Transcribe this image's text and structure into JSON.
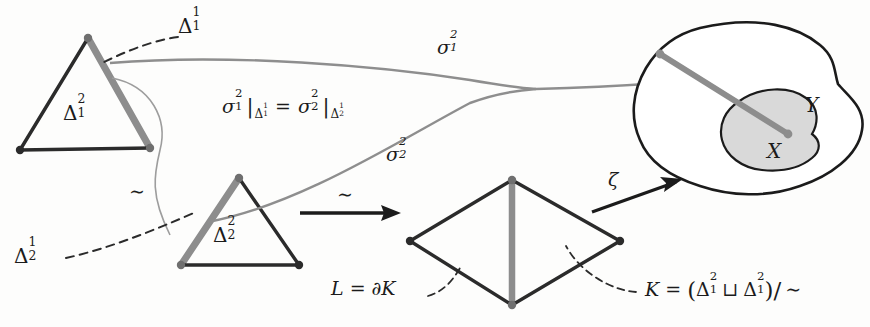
{
  "figure": {
    "colors": {
      "ink": "#1b1b1b",
      "gray_edge": "#8a8a8a",
      "gray_curve": "#9a9a9a",
      "shade_x": "#d8d8d8",
      "background": "#fdfdfc"
    },
    "labels": {
      "delta_1_1": {
        "base": "Δ",
        "sup": "1",
        "sub": "1"
      },
      "delta_1_2": {
        "base": "Δ",
        "sup": "2",
        "sub": "1"
      },
      "delta_2_1": {
        "base": "Δ",
        "sup": "1",
        "sub": "2"
      },
      "delta_2_2": {
        "base": "Δ",
        "sup": "2",
        "sub": "2"
      },
      "sigma_1_2": {
        "base": "σ",
        "sup": "2",
        "sub": "1"
      },
      "sigma_2_2": {
        "base": "σ",
        "sup": "2",
        "sub": "2"
      },
      "restriction_equation": "σ₁²|_{Δ₁¹} = σ₂²|_{Δ₂¹}",
      "zeta": "ζ",
      "tilde_left": "∼",
      "tilde_arrow": "∼",
      "space_y": "Y",
      "space_x": "X",
      "boundary_eq_lhs": "L",
      "boundary_eq_op": "=",
      "boundary_eq_rhs": "∂K",
      "quotient_eq": "K = (Δ₁² ⊔ Δ₁²)/ ∼",
      "quotient_K": "K",
      "quotient_equals": "=",
      "quotient_open": "(",
      "quotient_sqcup": "⊔",
      "quotient_close": ")/",
      "quotient_tilde": "∼"
    },
    "elements": {
      "triangle_top": "simplex-delta-1-squared",
      "triangle_bottom": "simplex-delta-2-squared",
      "diamond": "quotient-complex-K",
      "blob_outer": "space-Y",
      "blob_inner": "space-X"
    }
  }
}
